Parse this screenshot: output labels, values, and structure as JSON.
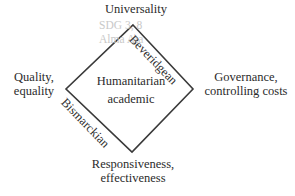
{
  "diagram": {
    "type": "diamond",
    "center": {
      "line1": "Humanitarian",
      "line2": "academic"
    },
    "vertices": {
      "top": {
        "line1": "Universality",
        "line2": ""
      },
      "left": {
        "line1": "Quality,",
        "line2": "equality"
      },
      "right": {
        "line1": "Governance,",
        "line2": "controlling costs"
      },
      "bottom": {
        "line1": "Responsiveness,",
        "line2": "effectiveness"
      }
    },
    "edges": {
      "upper_right": "Beveridgean",
      "lower_left": "Bismarckian"
    },
    "watermark": {
      "line1": "SDG 3, 8",
      "line2": "Alma Ata"
    },
    "colors": {
      "stroke": "#3a3a3a",
      "text": "#2b2b2b",
      "watermark": "#c9c9c9",
      "background": "#ffffff"
    },
    "geometry": {
      "top": [
        133,
        25
      ],
      "left": [
        66,
        89
      ],
      "right": [
        193,
        89
      ],
      "bottom": [
        132,
        152
      ]
    }
  }
}
